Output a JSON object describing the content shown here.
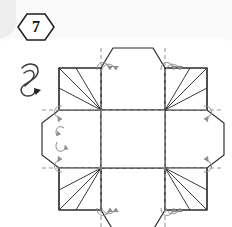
{
  "diagram": {
    "step_badge": {
      "label": "7",
      "shape": "hexagon"
    },
    "symbols": {
      "turn_over_label": "turn-over-arrow",
      "fold_arrow_label": "fold-arrow"
    },
    "legend": {
      "solid_line": "cut / visible edge",
      "dashed_line": "fold line",
      "thin_line": "crease"
    },
    "geometry": {
      "center_square": {
        "left": 101,
        "top": 110,
        "right": 165,
        "bottom": 168
      },
      "flap_count": 4,
      "corner_fan_count": 4,
      "fold_arrow_count": 8
    },
    "colors": {
      "ink": "#2a2a2a",
      "fold_guide": "#9a9a9a",
      "paper": "#ffffff",
      "badge_ink": "#111111"
    }
  }
}
